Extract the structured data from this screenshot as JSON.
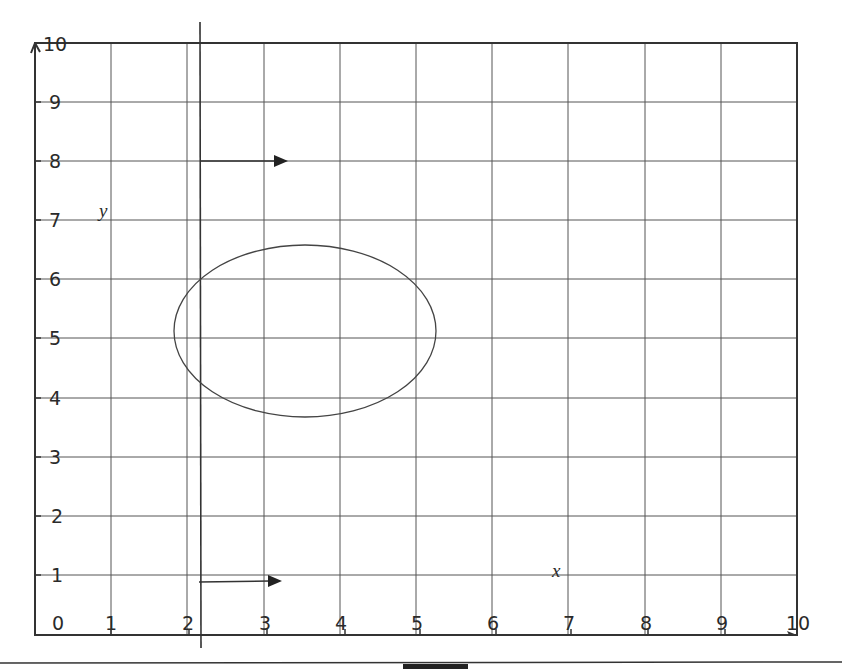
{
  "diagram": {
    "type": "coordinate-grid",
    "x_axis": {
      "label": "x",
      "range": [
        0,
        10
      ],
      "ticks": [
        "0",
        "1",
        "2",
        "3",
        "4",
        "5",
        "6",
        "7",
        "8",
        "9",
        "10"
      ]
    },
    "y_axis": {
      "label": "y",
      "range": [
        0,
        10
      ],
      "ticks": [
        "1",
        "2",
        "3",
        "4",
        "5",
        "6",
        "7",
        "8",
        "9",
        "10"
      ]
    },
    "mirror_line": {
      "orientation": "vertical",
      "x": 2.17
    },
    "shapes": [
      {
        "type": "ellipse",
        "cx": 3.5,
        "cy": 5.15,
        "rx": 1.72,
        "ry": 1.45
      }
    ],
    "arrows": [
      {
        "from": [
          2.17,
          8
        ],
        "to": [
          3.3,
          8
        ]
      },
      {
        "from": [
          2.17,
          0.9
        ],
        "to": [
          3.2,
          0.9
        ]
      }
    ],
    "colors": {
      "line": "#3a3a3a",
      "grid": "#555555",
      "background": "#ffffff"
    }
  }
}
